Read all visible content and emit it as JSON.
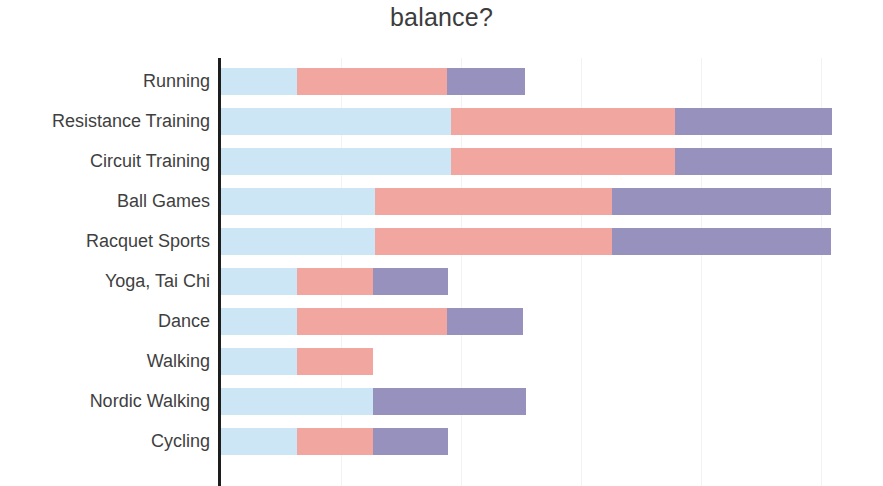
{
  "chart_data": {
    "type": "bar",
    "subtype": "stacked-horizontal",
    "title": "balance?",
    "xlabel": "",
    "ylabel": "",
    "grid": true,
    "grid_axis": "x",
    "legend": null,
    "legend_position": "none",
    "axis_tick_labels": [],
    "xlim": [
      0,
      5.1
    ],
    "bar_count": 10,
    "categories": [
      "Running",
      "Resistance Training",
      "Circuit Training",
      "Ball Games",
      "Racquet Sports",
      "Yoga, Tai Chi",
      "Dance",
      "Walking",
      "Nordic Walking",
      "Cycling"
    ],
    "series": [
      {
        "name": "segment-1",
        "color": "#cde6f5",
        "values": [
          0.63,
          1.92,
          1.92,
          1.28,
          1.28,
          0.63,
          0.63,
          0.63,
          1.27,
          0.63
        ]
      },
      {
        "name": "segment-2",
        "color": "#f2a6a0",
        "values": [
          1.25,
          1.86,
          1.86,
          1.98,
          1.98,
          0.64,
          1.25,
          0.64,
          0.0,
          0.64
        ]
      },
      {
        "name": "segment-3",
        "color": "#9791bd",
        "values": [
          0.65,
          1.31,
          1.31,
          1.82,
          1.82,
          0.62,
          0.64,
          0.0,
          1.27,
          0.62
        ]
      }
    ],
    "totals": [
      2.53,
      5.09,
      5.09,
      5.08,
      5.08,
      1.89,
      2.52,
      1.27,
      2.54,
      1.89
    ],
    "gridline_values": [
      1,
      2,
      3,
      4,
      5
    ],
    "colors": {
      "segment_1": "#cde6f5",
      "segment_2": "#f2a6a0",
      "segment_3": "#9791bd",
      "axis": "#1d1d1d",
      "grid": "#f2f2f4",
      "text": "#3f3f3f",
      "background": "#ffffff"
    }
  },
  "geometry": {
    "axis_x": 221,
    "unit_px": 120,
    "plot_top": 58,
    "row_pitch": 40,
    "bar_height": 27,
    "bar_offset": 10
  }
}
